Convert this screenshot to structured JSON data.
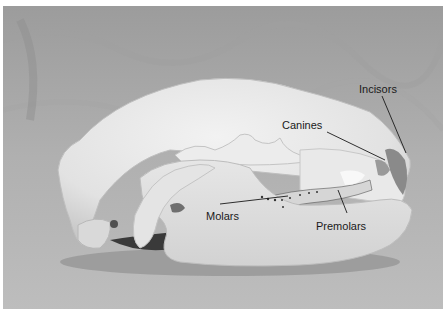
{
  "figure": {
    "labels": [
      {
        "id": "incisors",
        "text": "Incisors",
        "x": 359,
        "y": 84
      },
      {
        "id": "canines",
        "text": "Canines",
        "x": 282,
        "y": 120
      },
      {
        "id": "molars",
        "text": "Molars",
        "x": 206,
        "y": 211
      },
      {
        "id": "premolars",
        "text": "Premolars",
        "x": 316,
        "y": 221
      }
    ]
  }
}
